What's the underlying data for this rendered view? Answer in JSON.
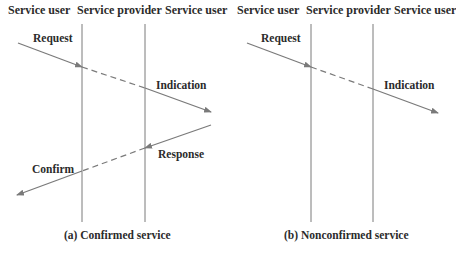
{
  "panels": [
    {
      "id": "a",
      "headers": [
        "Service user",
        "Service provider",
        "Service user"
      ],
      "caption": "(a) Confirmed service",
      "messages": [
        {
          "label": "Request",
          "direction": "left-to-right"
        },
        {
          "label": "Indication",
          "direction": "left-to-right"
        },
        {
          "label": "Response",
          "direction": "right-to-left"
        },
        {
          "label": "Confirm",
          "direction": "right-to-left"
        }
      ]
    },
    {
      "id": "b",
      "headers": [
        "Service user",
        "Service provider",
        "Service user"
      ],
      "caption": "(b) Nonconfirmed service",
      "messages": [
        {
          "label": "Request",
          "direction": "left-to-right"
        },
        {
          "label": "Indication",
          "direction": "left-to-right"
        }
      ]
    }
  ],
  "colors": {
    "line": "#7a7a7a",
    "text": "#2b2b2b"
  }
}
